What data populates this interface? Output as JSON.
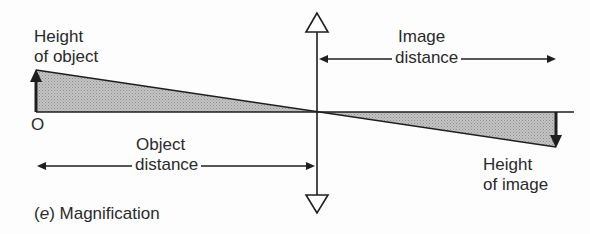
{
  "labels": {
    "height_of_object": [
      "Height",
      "of object"
    ],
    "origin": "O",
    "object_distance": [
      "Object",
      "distance"
    ],
    "image_distance": [
      "Image",
      "distance"
    ],
    "height_of_image": [
      "Height",
      "of image"
    ],
    "caption_letter": "e",
    "caption_text": "Magnification"
  },
  "colors": {
    "line": "#1e1e1e",
    "shade": "#b4b4b4",
    "text": "#2a2a2a"
  },
  "geometry": {
    "principal_axis_y": 112,
    "lens_x": 317,
    "object_x": 36,
    "object_top_y": 70,
    "image_x": 556,
    "image_bottom_y": 147
  }
}
